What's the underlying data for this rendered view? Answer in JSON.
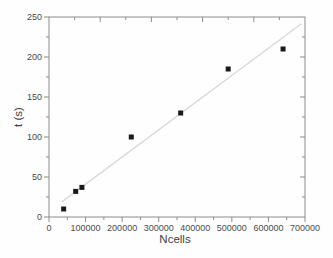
{
  "chart_data": {
    "type": "scatter",
    "title": "",
    "xlabel": "Ncells",
    "ylabel": "t (s)",
    "xlim": [
      0,
      700000
    ],
    "ylim": [
      0,
      250
    ],
    "x_major_ticks": [
      0,
      100000,
      200000,
      300000,
      400000,
      500000,
      600000,
      700000
    ],
    "x_minor_step": 50000,
    "y_major_ticks": [
      0,
      50,
      100,
      150,
      200,
      250
    ],
    "y_minor_step": 25,
    "grid": false,
    "legend": "none",
    "series": [
      {
        "name": "t vs Ncells",
        "marker": "square",
        "color": "#191919",
        "points": [
          [
            40000,
            10
          ],
          [
            73000,
            32
          ],
          [
            90000,
            37
          ],
          [
            225000,
            100
          ],
          [
            360000,
            130
          ],
          [
            490000,
            185
          ],
          [
            640000,
            210
          ]
        ]
      }
    ],
    "fit_line": {
      "slope": 0.00034,
      "intercept": 7,
      "x_start": 35000,
      "x_end": 690000,
      "color": "#d7dad6"
    },
    "colors": {
      "axis": "#8c8c8c",
      "text": "#4b4b4b",
      "background": "#ffffff"
    }
  }
}
